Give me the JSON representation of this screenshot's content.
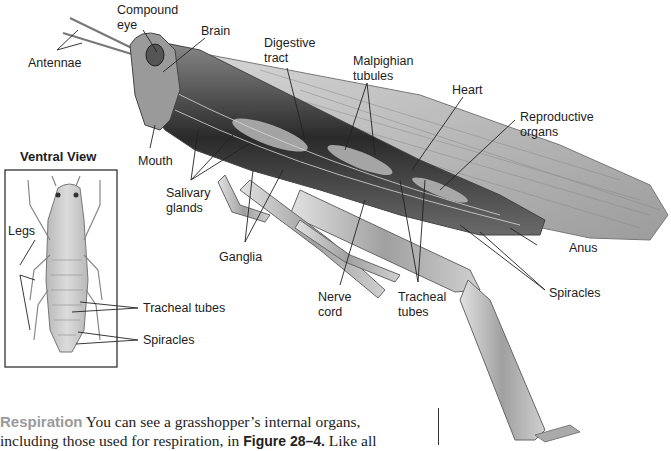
{
  "figure": {
    "labels": {
      "antennae": "Antennae",
      "compound_eye": "Compound\neye",
      "compound_eye_l1": "Compound",
      "compound_eye_l2": "eye",
      "brain": "Brain",
      "digestive_l1": "Digestive",
      "digestive_l2": "tract",
      "malpighian_l1": "Malpighian",
      "malpighian_l2": "tubules",
      "heart": "Heart",
      "reproductive_l1": "Reproductive",
      "reproductive_l2": "organs",
      "mouth": "Mouth",
      "salivary_l1": "Salivary",
      "salivary_l2": "glands",
      "ganglia": "Ganglia",
      "nerve_l1": "Nerve",
      "nerve_l2": "cord",
      "tracheal_l1": "Tracheal",
      "tracheal_l2": "tubes",
      "anus": "Anus",
      "spiracles": "Spiracles"
    },
    "ventral_view": {
      "title": "Ventral View",
      "labels": {
        "legs": "Legs",
        "tracheal_tubes": "Tracheal tubes",
        "spiracles": "Spiracles"
      }
    }
  },
  "body_text": {
    "heading": "Respiration",
    "line1_rest": " You can see a grasshopper’s internal organs,",
    "line2_pre": "including those used for respiration, in ",
    "figure_ref": "Figure 28–4.",
    "line2_post": " Like all"
  },
  "colors": {
    "heading_gray": "#9a9a9a",
    "text": "#222222",
    "background": "#ffffff"
  }
}
